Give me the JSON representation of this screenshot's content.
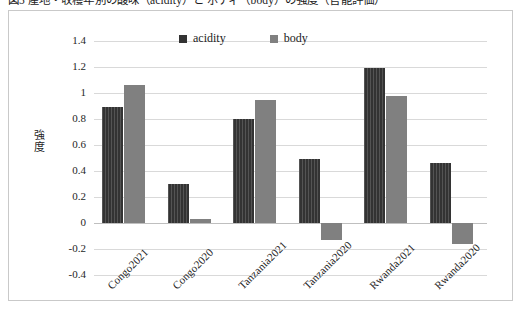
{
  "caption": {
    "text": "図5 産地・収穫年別の酸味（acidity）と ボディ（body）の強度（官能評価）"
  },
  "chart_data": {
    "type": "bar",
    "title": "",
    "subtitle": "",
    "xlabel": "",
    "ylabel": "強度",
    "categories": [
      "Congo2021",
      "Congo2020",
      "Tanzania2021",
      "Tanzania2020",
      "Rwanda2021",
      "Rwanda2020"
    ],
    "series": [
      {
        "name": "acidity",
        "color": "#333333",
        "values": [
          0.89,
          0.3,
          0.8,
          0.49,
          1.19,
          0.46
        ]
      },
      {
        "name": "body",
        "color": "#808080",
        "values": [
          1.06,
          0.03,
          0.95,
          -0.13,
          0.98,
          -0.16
        ]
      }
    ],
    "ylim": [
      -0.4,
      1.4
    ],
    "ytick_step": 0.2,
    "yticks": [
      "1.4",
      "1.2",
      "1",
      "0.8",
      "0.6",
      "0.4",
      "0.2",
      "0",
      "-0.2",
      "-0.4"
    ],
    "ytick_values": [
      1.4,
      1.2,
      1,
      0.8,
      0.6,
      0.4,
      0.2,
      0,
      -0.2,
      -0.4
    ],
    "grid": true,
    "legend_position": "top-center",
    "category_label_rotation": -45
  },
  "legend": {
    "items": [
      {
        "label": "acidity",
        "color": "#333333"
      },
      {
        "label": "body",
        "color": "#808080"
      }
    ]
  },
  "style": {
    "plot_background": "#ffffff",
    "frame_border": "#c9c9c9",
    "gridline_color": "#d9d9d9",
    "zero_line_color": "#bfbfbf",
    "text_color": "#1c1c1c"
  }
}
